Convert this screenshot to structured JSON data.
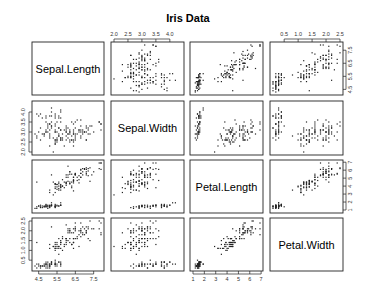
{
  "chart_data": {
    "type": "scatter",
    "subtype": "scatterplot-matrix",
    "title": "Iris Data",
    "variables": [
      "Sepal.Length",
      "Sepal.Width",
      "Petal.Length",
      "Petal.Width"
    ],
    "ranges": {
      "Sepal.Length": [
        4.3,
        7.9
      ],
      "Sepal.Width": [
        2.0,
        4.4
      ],
      "Petal.Length": [
        1.0,
        6.9
      ],
      "Petal.Width": [
        0.1,
        2.5
      ]
    },
    "axes": {
      "top": [
        {
          "column": 1,
          "variable": "Sepal.Width",
          "ticks": [
            "2.0",
            "2.5",
            "3.0",
            "3.5",
            "4.0"
          ]
        },
        {
          "column": 3,
          "variable": "Petal.Width",
          "ticks": [
            "0.5",
            "1.0",
            "1.5",
            "2.0",
            "2.5"
          ]
        }
      ],
      "bottom": [
        {
          "column": 0,
          "variable": "Sepal.Length",
          "ticks": [
            "4.5",
            "5.5",
            "6.5",
            "7.5"
          ]
        },
        {
          "column": 2,
          "variable": "Petal.Length",
          "ticks": [
            "1",
            "2",
            "3",
            "4",
            "5",
            "6",
            "7"
          ]
        }
      ],
      "left": [
        {
          "row": 1,
          "variable": "Sepal.Width",
          "ticks": [
            "2.0",
            "2.5",
            "3.0",
            "3.5",
            "4.0"
          ]
        },
        {
          "row": 3,
          "variable": "Petal.Width",
          "ticks": [
            "0.5",
            "1.0",
            "1.5",
            "2.0",
            "2.5"
          ]
        }
      ],
      "right": [
        {
          "row": 0,
          "variable": "Sepal.Length",
          "ticks": [
            "4.5",
            "5.5",
            "6.5",
            "7.5"
          ]
        },
        {
          "row": 2,
          "variable": "Petal.Length",
          "ticks": [
            "1",
            "2",
            "3",
            "4",
            "5",
            "6",
            "7"
          ]
        }
      ]
    },
    "species_groups": [
      {
        "name": "setosa",
        "n": 50,
        "mean": [
          5.01,
          3.43,
          1.46,
          0.25
        ],
        "sd": [
          0.35,
          0.38,
          0.17,
          0.11
        ]
      },
      {
        "name": "versicolor",
        "n": 50,
        "mean": [
          5.94,
          2.77,
          4.26,
          1.33
        ],
        "sd": [
          0.52,
          0.31,
          0.47,
          0.2
        ]
      },
      {
        "name": "virginica",
        "n": 50,
        "mean": [
          6.59,
          2.97,
          5.55,
          2.03
        ],
        "sd": [
          0.64,
          0.32,
          0.55,
          0.27
        ]
      }
    ],
    "grid": false,
    "legend": null
  }
}
